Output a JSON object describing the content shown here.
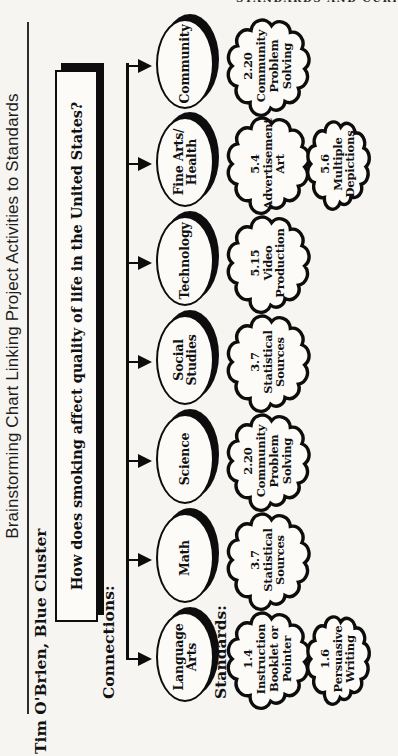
{
  "page": {
    "running_head": "STANDARDS AND CURRICULUM",
    "paper_color": "#f7f5f1",
    "ink_color": "#0d0d0d"
  },
  "chart": {
    "title": "Brainstorming Chart Linking Project Activities to Standards",
    "author": "Tim O'Brien, Blue Cluster",
    "labels": {
      "connections": "Connections:",
      "standards": "Standards:"
    },
    "question": "How does smoking affect quality of life in the United States?",
    "subjects": [
      {
        "label": "Language\nArts"
      },
      {
        "label": "Math"
      },
      {
        "label": "Science"
      },
      {
        "label": "Social\nStudies"
      },
      {
        "label": "Technology"
      },
      {
        "label": "Fine Arts/\nHealth"
      },
      {
        "label": "Community"
      }
    ],
    "standards": [
      {
        "col": 0,
        "row": 0,
        "text": "1.4\nInstruction\nBooklet or\nPointer"
      },
      {
        "col": 0,
        "row": 1,
        "text": "1.6\nPersuasive\nWriting"
      },
      {
        "col": 1,
        "row": 0,
        "text": "3.7\nStatistical\nSources"
      },
      {
        "col": 2,
        "row": 0,
        "text": "2.20\nCommunity\nProblem\nSolving"
      },
      {
        "col": 3,
        "row": 0,
        "text": "3.7\nStatistical\nSources"
      },
      {
        "col": 4,
        "row": 0,
        "text": "5.15\nVideo\nProduction"
      },
      {
        "col": 5,
        "row": 0,
        "text": "5.4\nAdvertisement\nArt"
      },
      {
        "col": 5,
        "row": 1,
        "text": "5.6\nMultiple\nDepictions"
      },
      {
        "col": 6,
        "row": 0,
        "text": "2.20\nCommunity\nProblem\nSolving"
      }
    ]
  }
}
